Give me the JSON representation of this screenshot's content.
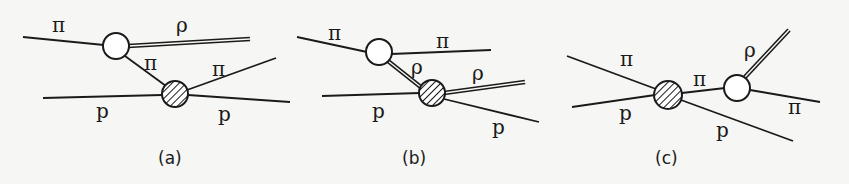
{
  "figure": {
    "panels": [
      {
        "caption": "(a)",
        "labels": {
          "pi_in": "π",
          "rho_out": "ρ",
          "pi_exchange": "π",
          "pi_out": "π",
          "p_in": "p",
          "p_out": "p"
        }
      },
      {
        "caption": "(b)",
        "labels": {
          "pi_in": "π",
          "pi_out": "π",
          "rho_exchange": "ρ",
          "rho_out": "ρ",
          "p_in": "p",
          "p_out": "p"
        }
      },
      {
        "caption": "(c)",
        "labels": {
          "pi_in": "π",
          "p_in": "p",
          "pi_exchange": "π",
          "rho_out": "ρ",
          "pi_out": "π",
          "p_out": "p"
        }
      }
    ],
    "legend": {
      "open_circle": "vertex",
      "hatched_circle": "scattering amplitude",
      "double_line": "ρ meson",
      "single_line": "π / p"
    }
  }
}
